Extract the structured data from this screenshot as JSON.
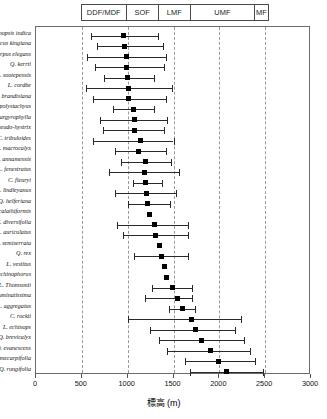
{
  "chart_data": {
    "type": "bar",
    "title": "",
    "xlabel": "標高 (m)",
    "ylabel": "",
    "xlim": [
      0,
      3000
    ],
    "xticks": [
      0,
      500,
      1000,
      1500,
      2000,
      2500,
      3000
    ],
    "xticklabels": [
      "0",
      "500",
      "1000",
      "1500",
      "2000",
      "2500",
      "3000"
    ],
    "gridlines": [
      500,
      1000,
      1500,
      2000,
      2500
    ],
    "grid": "vertical-dashed",
    "legend": "none",
    "orientation": "horizontal",
    "marker": "filled-square",
    "categories": [
      "Castanopsis indica",
      "Quercus kingiana",
      "Lithocarpus elegans",
      "Q. kerrii",
      "L. sootepensis",
      "L. cordbe",
      "Q. brandisiana",
      "L. polystachyus",
      "C. argyrophylla",
      "C. pseudo-hystrix",
      "C. tribuloides",
      "Q. macrocalyx",
      "L. annamensis",
      "L. fenestratus",
      "C. fleuryi",
      "L. lindleyanus",
      "Q. helferiana",
      "C. calathiformis",
      "C. diversifolia",
      "L. auriculatus",
      "Q. semiserrata",
      "Q. rex",
      "L. vestitus",
      "L. echinophorus",
      "L. Thomsonii",
      "C. acuminatissima",
      "L. aggregatus",
      "C. rockii",
      "L. echinops",
      "Q. brevicalyx",
      "Q. evanescens"
    ],
    "series": [
      {
        "name": "Elevation range (m)",
        "points": [
          {
            "label": "Castanopsis indica",
            "mean": 950,
            "low": 600,
            "high": 1330
          },
          {
            "label": "Quercus kingiana",
            "mean": 960,
            "low": 660,
            "high": 1380
          },
          {
            "label": "Lithocarpus elegans",
            "mean": 990,
            "low": 560,
            "high": 1420
          },
          {
            "label": "Q. kerrii",
            "mean": 990,
            "low": 640,
            "high": 1400
          },
          {
            "label": "L. sootepensis",
            "mean": 1000,
            "low": 740,
            "high": 1290
          },
          {
            "label": "L. cordbe",
            "mean": 1010,
            "low": 540,
            "high": 1480
          },
          {
            "label": "Q. brandisiana",
            "mean": 1010,
            "low": 620,
            "high": 1420
          },
          {
            "label": "L. polystachyus",
            "mean": 1060,
            "low": 840,
            "high": 1290
          },
          {
            "label": "C. argyrophylla",
            "mean": 1070,
            "low": 700,
            "high": 1430
          },
          {
            "label": "C. pseudo-hystrix",
            "mean": 1070,
            "low": 730,
            "high": 1400
          },
          {
            "label": "C. tribuloides",
            "mean": 1140,
            "low": 620,
            "high": 1500
          },
          {
            "label": "Q. macrocalyx",
            "mean": 1120,
            "low": 860,
            "high": 1420
          },
          {
            "label": "L. annamensis",
            "mean": 1190,
            "low": 930,
            "high": 1470
          },
          {
            "label": "L. fenestratus",
            "mean": 1180,
            "low": 800,
            "high": 1560
          },
          {
            "label": "C. fleuryi",
            "mean": 1190,
            "low": 1060,
            "high": 1370
          },
          {
            "label": "L. lindleyanus",
            "mean": 1200,
            "low": 860,
            "high": 1530
          },
          {
            "label": "Q. helferiana",
            "mean": 1220,
            "low": 1000,
            "high": 1460
          },
          {
            "label": "C. calathiformis",
            "mean": 1240,
            "low": 1240,
            "high": 1240
          },
          {
            "label": "C. diversifolia",
            "mean": 1290,
            "low": 880,
            "high": 1660
          },
          {
            "label": "L. auriculatus",
            "mean": 1300,
            "low": 950,
            "high": 1660
          },
          {
            "label": "Q. semiserrata",
            "mean": 1350,
            "low": 1350,
            "high": 1350
          },
          {
            "label": "Q. rex",
            "mean": 1370,
            "low": 1070,
            "high": 1660
          },
          {
            "label": "L. vestitus",
            "mean": 1400,
            "low": 1400,
            "high": 1400
          },
          {
            "label": "L. echinophorus",
            "mean": 1420,
            "low": 1420,
            "high": 1420
          },
          {
            "label": "L. Thomsonii",
            "mean": 1490,
            "low": 1260,
            "high": 1700
          },
          {
            "label": "C. acuminatissima",
            "mean": 1540,
            "low": 1190,
            "high": 1700
          },
          {
            "label": "L. aggregatus",
            "mean": 1600,
            "low": 1450,
            "high": 1730
          },
          {
            "label": "C. rockii",
            "mean": 1700,
            "low": 1000,
            "high": 2240
          },
          {
            "label": "L. echinops",
            "mean": 1740,
            "low": 1240,
            "high": 2170
          },
          {
            "label": "Q. brevicalyx",
            "mean": 1800,
            "low": 1340,
            "high": 2270
          },
          {
            "label": "Q. evanescens",
            "mean": 1900,
            "low": 1430,
            "high": 2330
          },
          {
            "label": "Q. semecarpifolia",
            "mean": 1990,
            "low": 1620,
            "high": 2390
          },
          {
            "label": "Q. rungifolia",
            "mean": 2080,
            "low": 1680,
            "high": 2480
          }
        ]
      }
    ]
  },
  "zone_header": {
    "cells": [
      {
        "label": "DDF/MDF",
        "start": 500,
        "end": 1000
      },
      {
        "label": "SOF",
        "start": 1000,
        "end": 1350
      },
      {
        "label": "LMF",
        "start": 1350,
        "end": 1700
      },
      {
        "label": "UMF",
        "start": 1700,
        "end": 2400
      },
      {
        "label": "MF",
        "start": 2400,
        "end": 2550
      }
    ]
  }
}
